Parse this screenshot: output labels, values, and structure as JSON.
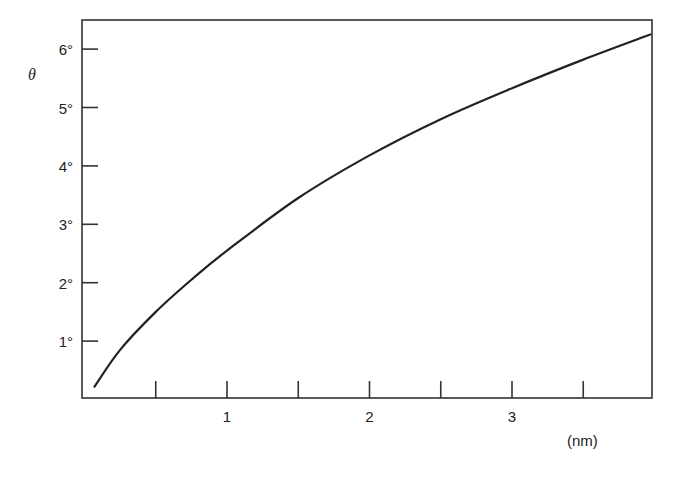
{
  "chart_data": {
    "type": "line",
    "title": "",
    "xlabel": "(nm)",
    "ylabel": "θ",
    "xlim": [
      0,
      4.0
    ],
    "ylim": [
      0,
      6.4
    ],
    "grid": false,
    "legend": null,
    "x_ticks_major": [
      1,
      2,
      3
    ],
    "x_tick_labels": [
      "1",
      "2",
      "3"
    ],
    "x_ticks_minor": [
      0.5,
      1.5,
      2.5,
      3.5
    ],
    "y_ticks": [
      1,
      2,
      3,
      4,
      5,
      6
    ],
    "y_tick_labels": [
      "1°",
      "2°",
      "3°",
      "4°",
      "5°",
      "6°"
    ],
    "series": [
      {
        "name": "θ",
        "x": [
          0.07,
          0.25,
          0.5,
          0.75,
          1.0,
          1.5,
          2.0,
          2.5,
          3.0,
          3.5,
          3.97
        ],
        "values": [
          0.22,
          0.85,
          1.5,
          2.05,
          2.55,
          3.45,
          4.18,
          4.8,
          5.33,
          5.82,
          6.25
        ]
      }
    ]
  }
}
